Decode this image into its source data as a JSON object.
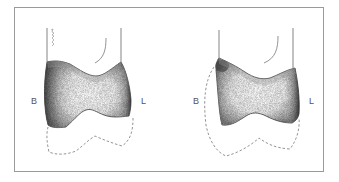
{
  "figure": {
    "panels": [
      {
        "id": "left",
        "labels": {
          "buccal": "B",
          "lingual": "L"
        }
      },
      {
        "id": "right",
        "labels": {
          "buccal": "B",
          "lingual": "L"
        }
      }
    ],
    "colors": {
      "frame": "#9a9a9a",
      "outline": "#555555",
      "dashed": "#777777",
      "shade_dark": "#3a3a3a",
      "shade_light": "#d8d8d8"
    }
  }
}
